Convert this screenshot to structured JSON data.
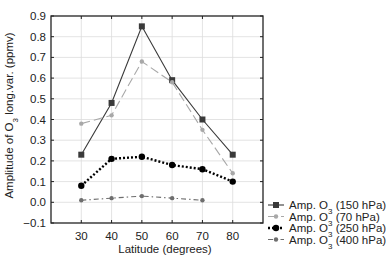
{
  "chart_data": {
    "type": "line",
    "title": "",
    "xlabel": "Latitude (degrees)",
    "ylabel_prefix": "Amplitude of O",
    "ylabel_sub": "3",
    "ylabel_suffix": " long.var. (ppmv)",
    "ylabel": "Amplitude of O3 long.var. (ppmv)",
    "xlim": [
      20,
      90
    ],
    "ylim": [
      -0.1,
      0.9
    ],
    "grid": true,
    "legend_position": "lower right, outside plot",
    "x_ticks": [
      30,
      40,
      50,
      60,
      70,
      80
    ],
    "x_tick_labels": [
      "30",
      "40",
      "50",
      "60",
      "70",
      "80"
    ],
    "y_ticks": [
      -0.1,
      0.0,
      0.1,
      0.2,
      0.3,
      0.4,
      0.5,
      0.6,
      0.7,
      0.8,
      0.9
    ],
    "y_tick_labels": [
      "−0.1",
      "0.0",
      "0.1",
      "0.2",
      "0.3",
      "0.4",
      "0.5",
      "0.6",
      "0.7",
      "0.8",
      "0.9"
    ],
    "series": [
      {
        "name": "Amp. O3 (150 hPa)",
        "legend_prefix": "Amp. O",
        "legend_sub": "3",
        "legend_suffix": " (150 hPa)",
        "x": [
          30,
          40,
          50,
          60,
          70,
          80
        ],
        "values": [
          0.23,
          0.48,
          0.85,
          0.59,
          0.4,
          0.23
        ],
        "color": "#3a3a3a",
        "line": "solid",
        "marker": "square"
      },
      {
        "name": "Amp. O3 (70 hPa)",
        "legend_prefix": "Amp. O",
        "legend_sub": "3",
        "legend_suffix": " (70 hPa)",
        "x": [
          30,
          40,
          50,
          60,
          70,
          80
        ],
        "values": [
          0.38,
          0.42,
          0.68,
          0.58,
          0.35,
          0.14
        ],
        "color": "#a8a8a8",
        "line": "long-dash",
        "marker": "circle-small"
      },
      {
        "name": "Amp. O3 (250 hPa)",
        "legend_prefix": "Amp. O",
        "legend_sub": "3",
        "legend_suffix": " (250 hPa)",
        "x": [
          30,
          40,
          50,
          60,
          70,
          80
        ],
        "values": [
          0.08,
          0.21,
          0.22,
          0.18,
          0.16,
          0.1
        ],
        "color": "#000000",
        "line": "dotted",
        "marker": "circle"
      },
      {
        "name": "Amp. O3 (400 hPa)",
        "legend_prefix": "Amp. O",
        "legend_sub": "3",
        "legend_suffix": " (400 hPa)",
        "x": [
          30,
          40,
          50,
          60,
          70
        ],
        "values": [
          0.01,
          0.02,
          0.03,
          0.02,
          0.01
        ],
        "color": "#6e6e6e",
        "line": "dash-dot",
        "marker": "circle-small"
      }
    ]
  }
}
